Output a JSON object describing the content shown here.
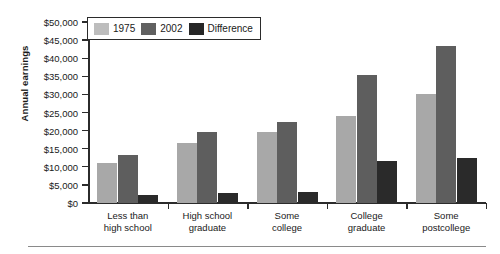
{
  "chart_data": {
    "type": "bar",
    "title": "",
    "xlabel": "",
    "ylabel": "Annual earnings",
    "ylim": [
      0,
      50000
    ],
    "grid": false,
    "legend_position": "top-left",
    "categories": [
      "Less than\nhigh school",
      "High school\ngraduate",
      "Some\ncollege",
      "College\ngraduate",
      "Some\npostcollege"
    ],
    "category_lines": [
      [
        "Less than",
        "high school"
      ],
      [
        "High school",
        "graduate"
      ],
      [
        "Some",
        "college"
      ],
      [
        "College",
        "graduate"
      ],
      [
        "Some",
        "postcollege"
      ]
    ],
    "series": [
      {
        "name": "1975",
        "color": "#a8a8a8",
        "values": [
          11000,
          16500,
          19500,
          24000,
          30000
        ]
      },
      {
        "name": "2002",
        "color": "#5e5e5e",
        "values": [
          13200,
          19500,
          22500,
          35500,
          43500
        ]
      },
      {
        "name": "Difference",
        "color": "#2a2a2a",
        "values": [
          2300,
          2700,
          3000,
          11500,
          12500
        ]
      }
    ],
    "ytick_values": [
      0,
      5000,
      10000,
      15000,
      20000,
      25000,
      30000,
      35000,
      40000,
      45000,
      50000
    ],
    "ytick_labels": [
      "$0",
      "$5,000",
      "$10,000",
      "$15,000",
      "$20,000",
      "$25,000",
      "$30,000",
      "$35,000",
      "$40,000",
      "$45,000",
      "$50,000"
    ]
  },
  "legend": {
    "items": [
      {
        "label": "1975",
        "swatch": "s1975"
      },
      {
        "label": "2002",
        "swatch": "s2002"
      },
      {
        "label": "Difference",
        "swatch": "sdiff"
      }
    ]
  }
}
